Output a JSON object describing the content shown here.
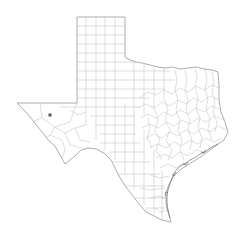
{
  "map": {
    "region": "Texas",
    "subdivision": "counties",
    "background_color": "#ffffff",
    "border_color": "#8a8a8a",
    "county_line_color": "#b4b4b4",
    "marker": {
      "shape": "square-dot",
      "color": "#555555",
      "x": 50,
      "y": 115,
      "size": 3
    }
  }
}
